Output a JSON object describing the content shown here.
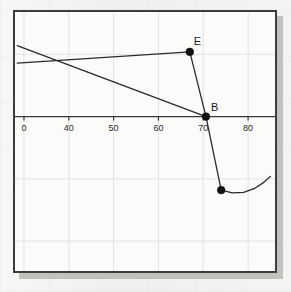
{
  "figure": {
    "background_color": "#efeeec",
    "plot_background_color": "#fbfbfa",
    "frame_color": "#3d3d3d",
    "shadow_color": "#b8b7b4",
    "grid_color": "#e2e1de",
    "line_color": "#2b2b2b",
    "point_color": "#111111"
  },
  "chart_data": {
    "type": "scatter",
    "title": "",
    "xlabel": "",
    "ylabel": "",
    "grid": true,
    "legend": null,
    "xlim": [
      28,
      86
    ],
    "ylim": [
      -62,
      42
    ],
    "x_ticks": [
      30,
      40,
      50,
      60,
      70,
      80
    ],
    "x_tick_labels": [
      "0",
      "40",
      "50",
      "60",
      "70",
      "80"
    ],
    "x_tick_label_full": [
      "30",
      "40",
      "50",
      "60",
      "70",
      "80"
    ],
    "x_tick_note": "leftmost tick label 30 is clipped by the plot frame, only '0' visible",
    "y_ticks": [],
    "y_tick_labels": [],
    "axis_line_y": 0,
    "points": [
      {
        "label": "E",
        "x": 67.0,
        "y": 26.0,
        "label_dx": 4,
        "label_dy": -7,
        "marker": "o",
        "size": 5
      },
      {
        "label": "B",
        "x": 70.6,
        "y": 0.0,
        "label_dx": 5,
        "label_dy": -6,
        "marker": "o",
        "size": 5
      },
      {
        "label": "",
        "x": 74.0,
        "y": -29.5,
        "label_dx": 0,
        "label_dy": 0,
        "marker": "o",
        "size": 5
      }
    ],
    "series": [
      {
        "name": "line-1",
        "type": "line",
        "x": [
          28.5,
          70.6
        ],
        "y": [
          28.5,
          0.0
        ],
        "note": "descending line from upper-left edge to point B"
      },
      {
        "name": "line-2",
        "type": "line",
        "x": [
          28.5,
          67.0
        ],
        "y": [
          21.5,
          26.0
        ],
        "note": "ascending line from left edge to point E"
      },
      {
        "name": "segment-EB",
        "type": "line",
        "x": [
          67.0,
          70.6
        ],
        "y": [
          26.0,
          0.0
        ],
        "note": "segment joining E to B"
      },
      {
        "name": "segment-B-lower",
        "type": "line",
        "x": [
          70.6,
          74.0
        ],
        "y": [
          0.0,
          -29.5
        ],
        "note": "segment from B down to lower vertex"
      },
      {
        "name": "curve-arc",
        "type": "line",
        "x": [
          74.0,
          76.5,
          79.0,
          81.5,
          83.5,
          85.0
        ],
        "y": [
          -29.5,
          -30.6,
          -30.4,
          -28.8,
          -26.4,
          -24.0
        ],
        "note": "shallow upward-curving arc extending right from the lower vertex"
      }
    ]
  }
}
